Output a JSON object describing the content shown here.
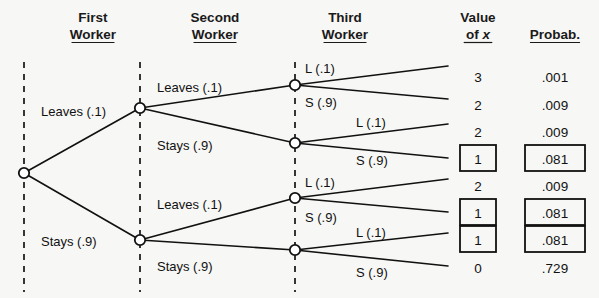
{
  "diagram": {
    "title_columns": [
      {
        "id": "first-worker",
        "line1": "First",
        "line2": "Worker",
        "x": 93,
        "underline": true
      },
      {
        "id": "second-worker",
        "line1": "Second",
        "line2": "Worker",
        "x": 215,
        "underline": true
      },
      {
        "id": "third-worker",
        "line1": "Third",
        "line2": "Worker",
        "x": 345,
        "underline": true
      },
      {
        "id": "value-of-x",
        "line1": "Value",
        "line2": "of x",
        "x": 478,
        "underline": true,
        "italic_tail": "x"
      },
      {
        "id": "probability",
        "line1": "",
        "line2": "Probab.",
        "x": 555,
        "underline": true
      }
    ],
    "guides": [
      {
        "id": "guide-level-1",
        "x": 24,
        "y1": 62,
        "y2": 292
      },
      {
        "id": "guide-level-2",
        "x": 140,
        "y1": 62,
        "y2": 292
      },
      {
        "id": "guide-level-3",
        "x": 295,
        "y1": 62,
        "y2": 292
      }
    ],
    "nodes": [
      {
        "id": "root",
        "x": 24,
        "y": 173
      },
      {
        "id": "n-L",
        "x": 140,
        "y": 108
      },
      {
        "id": "n-S",
        "x": 140,
        "y": 240
      },
      {
        "id": "n-LL",
        "x": 295,
        "y": 85
      },
      {
        "id": "n-LS",
        "x": 295,
        "y": 143
      },
      {
        "id": "n-SL",
        "x": 295,
        "y": 198
      },
      {
        "id": "n-SS",
        "x": 295,
        "y": 250
      }
    ],
    "edges": [
      {
        "id": "edge-root-L",
        "x1": 24,
        "y1": 173,
        "x2": 140,
        "y2": 108
      },
      {
        "id": "edge-root-S",
        "x1": 24,
        "y1": 173,
        "x2": 140,
        "y2": 240
      },
      {
        "id": "edge-L-LL",
        "x1": 140,
        "y1": 108,
        "x2": 295,
        "y2": 85
      },
      {
        "id": "edge-L-LS",
        "x1": 140,
        "y1": 108,
        "x2": 295,
        "y2": 143
      },
      {
        "id": "edge-S-SL",
        "x1": 140,
        "y1": 240,
        "x2": 295,
        "y2": 198
      },
      {
        "id": "edge-S-SS",
        "x1": 140,
        "y1": 240,
        "x2": 295,
        "y2": 250
      },
      {
        "id": "edge-LL-o1",
        "x1": 295,
        "y1": 85,
        "x2": 448,
        "y2": 66
      },
      {
        "id": "edge-LL-o2",
        "x1": 295,
        "y1": 85,
        "x2": 448,
        "y2": 99
      },
      {
        "id": "edge-LS-o3",
        "x1": 295,
        "y1": 143,
        "x2": 448,
        "y2": 124
      },
      {
        "id": "edge-LS-o4",
        "x1": 295,
        "y1": 143,
        "x2": 448,
        "y2": 158
      },
      {
        "id": "edge-SL-o5",
        "x1": 295,
        "y1": 198,
        "x2": 448,
        "y2": 179
      },
      {
        "id": "edge-SL-o6",
        "x1": 295,
        "y1": 198,
        "x2": 448,
        "y2": 212
      },
      {
        "id": "edge-SS-o7",
        "x1": 295,
        "y1": 250,
        "x2": 448,
        "y2": 233
      },
      {
        "id": "edge-SS-o8",
        "x1": 295,
        "y1": 250,
        "x2": 448,
        "y2": 266
      }
    ],
    "branch_labels": [
      {
        "id": "label-first-leaves",
        "text": "Leaves (.1)",
        "x": 41,
        "y": 116
      },
      {
        "id": "label-first-stays",
        "text": "Stays (.9)",
        "x": 41,
        "y": 246
      },
      {
        "id": "label-second-leaves-top",
        "text": "Leaves (.1)",
        "x": 157,
        "y": 92
      },
      {
        "id": "label-second-stays-top",
        "text": "Stays (.9)",
        "x": 157,
        "y": 150
      },
      {
        "id": "label-second-leaves-bot",
        "text": "Leaves (.1)",
        "x": 157,
        "y": 209
      },
      {
        "id": "label-second-stays-bot",
        "text": "Stays (.9)",
        "x": 157,
        "y": 271
      },
      {
        "id": "label-third-l-1",
        "text": "L (.1)",
        "x": 305,
        "y": 73
      },
      {
        "id": "label-third-s-1",
        "text": "S (.9)",
        "x": 305,
        "y": 107
      },
      {
        "id": "label-third-l-2",
        "text": "L (.1)",
        "x": 356,
        "y": 127
      },
      {
        "id": "label-third-s-2",
        "text": "S (.9)",
        "x": 356,
        "y": 165
      },
      {
        "id": "label-third-l-3",
        "text": "L (.1)",
        "x": 305,
        "y": 187
      },
      {
        "id": "label-third-s-3",
        "text": "S (.9)",
        "x": 305,
        "y": 222
      },
      {
        "id": "label-third-l-4",
        "text": "L (.1)",
        "x": 356,
        "y": 237
      },
      {
        "id": "label-third-s-4",
        "text": "S (.9)",
        "x": 356,
        "y": 277
      }
    ],
    "outcomes": [
      {
        "id": "outcome-1",
        "y": 77,
        "value": "3",
        "probability": ".001",
        "highlighted": false
      },
      {
        "id": "outcome-2",
        "y": 105,
        "value": "2",
        "probability": ".009",
        "highlighted": false
      },
      {
        "id": "outcome-3",
        "y": 132,
        "value": "2",
        "probability": ".009",
        "highlighted": false
      },
      {
        "id": "outcome-4",
        "y": 159,
        "value": "1",
        "probability": ".081",
        "highlighted": true
      },
      {
        "id": "outcome-5",
        "y": 186,
        "value": "2",
        "probability": ".009",
        "highlighted": false
      },
      {
        "id": "outcome-6",
        "y": 213,
        "value": "1",
        "probability": ".081",
        "highlighted": true
      },
      {
        "id": "outcome-7",
        "y": 240,
        "value": "1",
        "probability": ".081",
        "highlighted": true
      },
      {
        "id": "outcome-8",
        "y": 268,
        "value": "0",
        "probability": ".729",
        "highlighted": false
      }
    ],
    "columns_x": {
      "value": 478,
      "probability": 555
    },
    "colors": {
      "ink": "#111111",
      "background": "#f7f7f5"
    }
  }
}
